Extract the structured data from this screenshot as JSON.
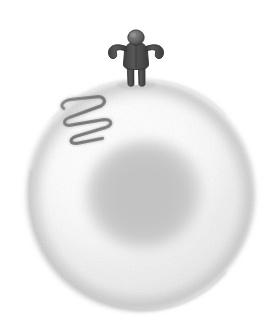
{
  "scene": {
    "title": "Human figure standing on a cell",
    "background_color": "#ffffff",
    "width": 275,
    "height": 329
  },
  "cell": {
    "name": "cell-body",
    "description": "Large pale gray rounded cell occupying most of the frame",
    "center_x": 140,
    "center_y": 196,
    "radius_x": 115,
    "radius_y": 116,
    "fill_color": "#f2f2f2",
    "rim_color": "#d8d8d8",
    "highlight_color": "#fbfbfb"
  },
  "nucleus": {
    "name": "cell-nucleus",
    "description": "Soft darker gray nucleus inside the cell",
    "center_x": 146,
    "center_y": 200,
    "radius_x": 62,
    "radius_y": 60,
    "fill_color": "#c9c9c9",
    "edge_color": "#d9d9d9"
  },
  "squiggle": {
    "name": "coiled-squiggle",
    "description": "Dark gray serpentine coil on the upper-left of the cell",
    "stroke_color": "#8c8c8c",
    "stroke_width": 3.2,
    "loops": 3,
    "bounds": {
      "x": 62,
      "y": 94,
      "width": 46,
      "height": 44
    }
  },
  "figure": {
    "name": "human-figure",
    "body_color": "#4a4a4a",
    "head_color": "#6b6b6b",
    "outline_color": "#3a3a3a",
    "pose": "arms-outstretched",
    "bounds": {
      "x": 118,
      "y": 32,
      "width": 36,
      "height": 54
    },
    "parts": [
      "head",
      "torso",
      "left-arm",
      "right-arm",
      "left-leg",
      "right-leg"
    ]
  }
}
